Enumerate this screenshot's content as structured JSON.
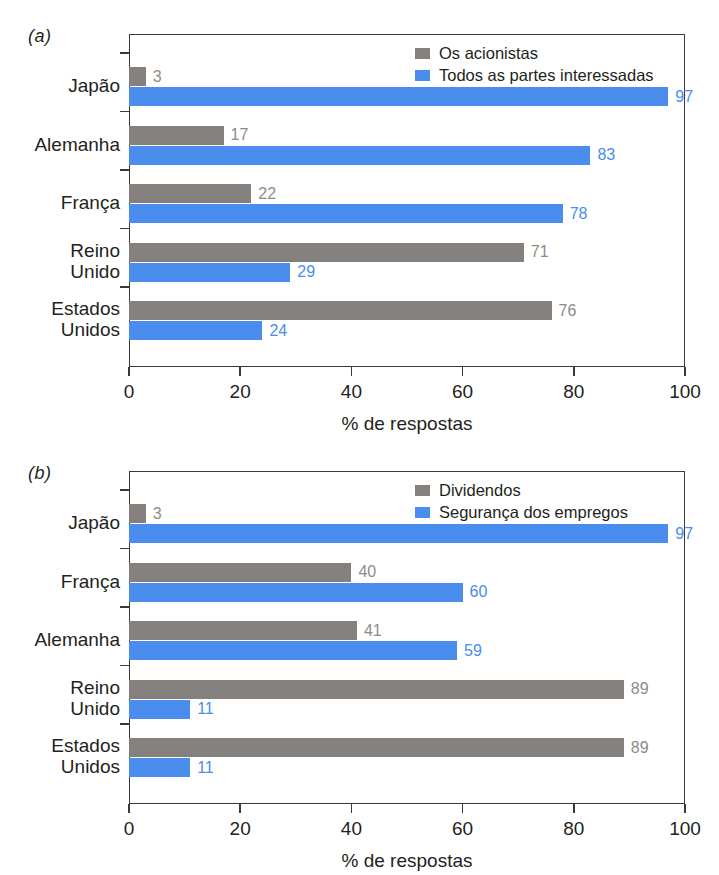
{
  "colors": {
    "series_gray": "#83807e",
    "series_blue": "#4a8ded",
    "axis": "#3a3a3a",
    "text": "#231f20",
    "gray_value_text": "#8d8b89",
    "blue_value_text": "#4a8ded",
    "background": "#ffffff"
  },
  "panels": [
    {
      "letter": "(a)",
      "xlabel": "% de respostas",
      "legend": [
        "Os acionistas",
        "Todos as partes interessadas"
      ],
      "categories": [
        "Japão",
        "Alemanha",
        "França",
        "Reino\nUnido",
        "Estados\nUnidos"
      ]
    },
    {
      "letter": "(b)",
      "xlabel": "% de respostas",
      "legend": [
        "Dividendos",
        "Segurança dos empregos"
      ],
      "categories": [
        "Japão",
        "França",
        "Alemanha",
        "Reino\nUnido",
        "Estados\nUnidos"
      ]
    }
  ],
  "xticks": [
    "0",
    "20",
    "40",
    "60",
    "80",
    "100"
  ],
  "chart_data": [
    {
      "type": "bar",
      "title": "(a)",
      "orientation": "horizontal",
      "xlabel": "% de respostas",
      "ylabel": "",
      "xlim": [
        0,
        100
      ],
      "xticks": [
        0,
        20,
        40,
        60,
        80,
        100
      ],
      "grid": false,
      "legend_position": "top-right",
      "categories": [
        "Japão",
        "Alemanha",
        "França",
        "Reino Unido",
        "Estados Unidos"
      ],
      "series": [
        {
          "name": "Os acionistas",
          "color": "#83807e",
          "values": [
            3,
            17,
            22,
            71,
            76
          ]
        },
        {
          "name": "Todos as partes interessadas",
          "color": "#4a8ded",
          "values": [
            97,
            83,
            78,
            29,
            24
          ]
        }
      ]
    },
    {
      "type": "bar",
      "title": "(b)",
      "orientation": "horizontal",
      "xlabel": "% de respostas",
      "ylabel": "",
      "xlim": [
        0,
        100
      ],
      "xticks": [
        0,
        20,
        40,
        60,
        80,
        100
      ],
      "grid": false,
      "legend_position": "top-right",
      "categories": [
        "Japão",
        "França",
        "Alemanha",
        "Reino Unido",
        "Estados Unidos"
      ],
      "series": [
        {
          "name": "Dividendos",
          "color": "#83807e",
          "values": [
            3,
            40,
            41,
            89,
            89
          ]
        },
        {
          "name": "Segurança dos empregos",
          "color": "#4a8ded",
          "values": [
            97,
            60,
            59,
            11,
            11
          ]
        }
      ]
    }
  ]
}
